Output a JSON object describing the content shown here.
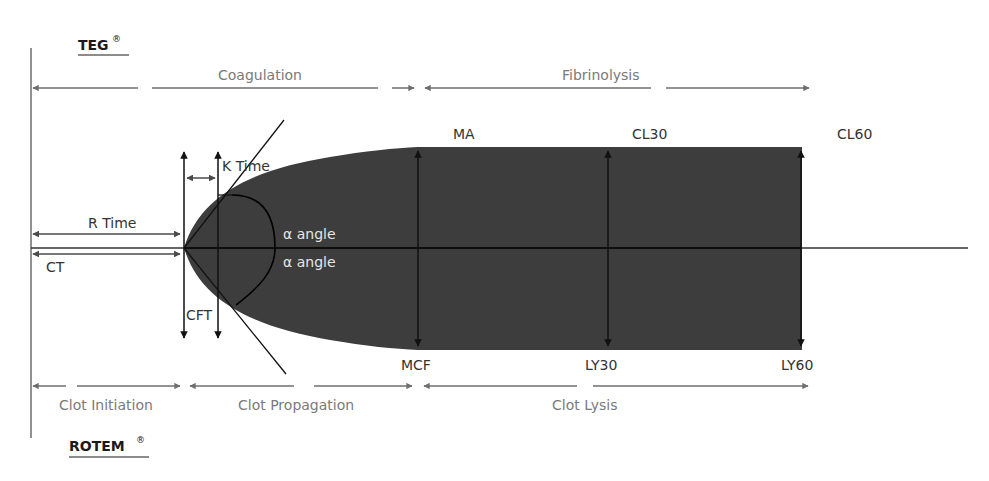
{
  "brands": {
    "top": "TEG",
    "bottom": "ROTEM",
    "registered_mark": "®"
  },
  "top_phases": {
    "coagulation": "Coagulation",
    "fibrinolysis": "Fibrinolysis"
  },
  "bottom_phases": {
    "clot_initiation": "Clot Initiation",
    "clot_propagation": "Clot Propagation",
    "clot_lysis": "Clot Lysis"
  },
  "teg_parameters": {
    "r_time": "R Time",
    "k_time": "K Time",
    "alpha_angle": "α angle",
    "ma": "MA",
    "cl30": "CL30",
    "cl60": "CL60"
  },
  "rotem_parameters": {
    "ct": "CT",
    "cft": "CFT",
    "alpha_angle": "α angle",
    "mcf": "MCF",
    "ly30": "LY30",
    "ly60": "LY60"
  },
  "colors": {
    "trace_fill": "#3d3d3d",
    "phase_arrow": "#6e6e6e",
    "annotation_line": "#111111",
    "background": "#ffffff"
  }
}
